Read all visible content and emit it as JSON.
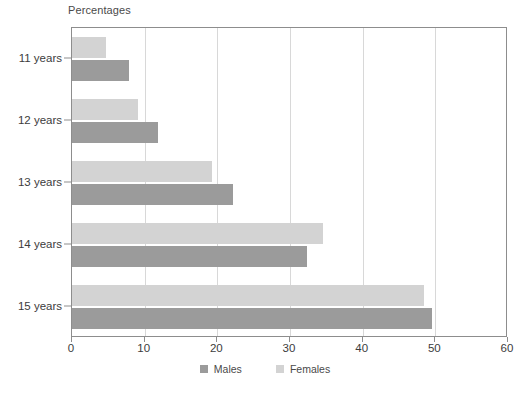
{
  "chart_data": {
    "type": "bar",
    "orientation": "horizontal",
    "title": "Percentages",
    "xlabel": "",
    "ylabel": "",
    "categories": [
      "11 years",
      "12 years",
      "13 years",
      "14 years",
      "15 years"
    ],
    "series": [
      {
        "name": "Females",
        "color": "#d3d3d3",
        "values": [
          4.7,
          9.1,
          19.3,
          34.5,
          48.5
        ]
      },
      {
        "name": "Males",
        "color": "#9b9b9b",
        "values": [
          7.8,
          11.8,
          22.2,
          32.3,
          49.5
        ]
      }
    ],
    "xlim": [
      0,
      60
    ],
    "xticks": [
      0,
      10,
      20,
      30,
      40,
      50,
      60
    ],
    "xtick_labels": [
      "0",
      "10",
      "20",
      "30",
      "40",
      "50",
      "60"
    ],
    "grid": "vertical",
    "legend_position": "bottom",
    "frame_color": "#8d8d8d",
    "gridline_color": "#d8d8d8"
  },
  "legend": {
    "items": [
      {
        "label": "Males",
        "color": "#9b9b9b"
      },
      {
        "label": "Females",
        "color": "#d3d3d3"
      }
    ]
  }
}
